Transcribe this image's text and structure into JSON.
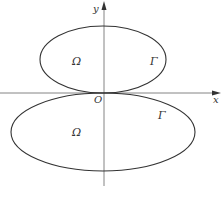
{
  "figure": {
    "type": "region-boundary-diagram",
    "colors": {
      "curve": "#333333",
      "axis": "#555555",
      "background": "#ffffff"
    },
    "axes": {
      "x_label": "x",
      "y_label": "y",
      "origin_label": "O"
    },
    "upper_region": {
      "region_label": "Ω",
      "boundary_label": "Γ",
      "shape": "ellipse",
      "position": "above x-axis, tangent at origin"
    },
    "lower_region": {
      "region_label": "Ω",
      "boundary_label": "Γ",
      "shape": "ellipse",
      "position": "below x-axis, tangent at origin"
    }
  }
}
